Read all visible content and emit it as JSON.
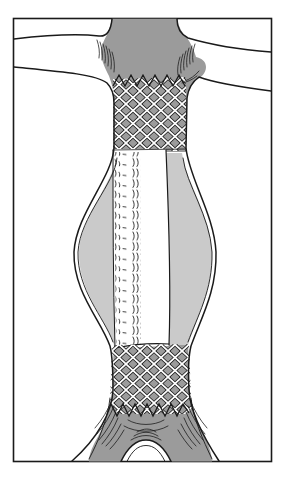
{
  "canvas": {
    "width": 284,
    "height": 486
  },
  "illustration": {
    "name": "aortic-aneurysm-stent-graft-diagram",
    "style": "black-and-white medical line drawing with gray shading",
    "parts": [
      "abdominal-aorta",
      "left-renal-artery",
      "right-renal-artery",
      "proximal-bare-stent-mesh",
      "stent-graft-fabric-tube",
      "aneurysm-sac",
      "distal-bare-stent-mesh",
      "aortic-bifurcation",
      "iliac-arteries"
    ]
  },
  "colors": {
    "outline": "#1a1a1a",
    "lumen_gray": "#9b9b9b",
    "sac_gray": "#cacaca",
    "vessel_white": "#ffffff",
    "background": "#ffffff"
  }
}
